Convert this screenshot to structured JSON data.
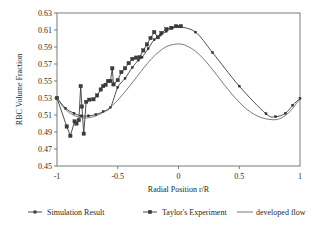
{
  "chart_data": {
    "type": "line",
    "title": "",
    "xlabel": "Radial Position r/R",
    "ylabel": "RBC Volume Fraction",
    "xlim": [
      -1,
      1
    ],
    "ylim": [
      0.45,
      0.63
    ],
    "xticks": [
      -1,
      -0.5,
      0,
      0.5,
      1
    ],
    "xticklabels": [
      "-1",
      "-0.5",
      "0",
      "0.5",
      "1"
    ],
    "yticks": [
      0.45,
      0.47,
      0.49,
      0.51,
      0.53,
      0.55,
      0.57,
      0.59,
      0.61,
      0.63
    ],
    "yticklabels": [
      "0.45",
      "0.47",
      "0.49",
      "0.51",
      "0.53",
      "0.55",
      "0.57",
      "0.59",
      "0.61",
      "0.63"
    ],
    "grid": false,
    "legend_position": "bottom",
    "series": [
      {
        "name": "Simulation Result",
        "marker": "small-dot",
        "line": true,
        "points": [
          [
            -1.0,
            0.53
          ],
          [
            -0.93,
            0.518
          ],
          [
            -0.86,
            0.512
          ],
          [
            -0.8,
            0.509
          ],
          [
            -0.74,
            0.509
          ],
          [
            -0.68,
            0.5105
          ],
          [
            -0.62,
            0.514
          ],
          [
            -0.56,
            0.519
          ],
          [
            -0.5,
            0.5425
          ],
          [
            -0.44,
            0.553
          ],
          [
            -0.38,
            0.566
          ],
          [
            -0.33,
            0.5745
          ],
          [
            -0.3,
            0.578
          ],
          [
            -0.25,
            0.588
          ],
          [
            -0.2,
            0.5985
          ],
          [
            -0.15,
            0.604
          ],
          [
            -0.1,
            0.6085
          ],
          [
            -0.05,
            0.6125
          ],
          [
            0.0,
            0.614
          ],
          [
            0.14,
            0.6075
          ],
          [
            0.28,
            0.5835
          ],
          [
            0.5,
            0.544
          ],
          [
            0.72,
            0.5115
          ],
          [
            0.8,
            0.508
          ],
          [
            0.88,
            0.512
          ],
          [
            0.94,
            0.5215
          ],
          [
            1.0,
            0.5295
          ]
        ]
      },
      {
        "name": "Taylor's Experiment",
        "marker": "square",
        "line": true,
        "points": [
          [
            -1.0,
            0.53
          ],
          [
            -0.92,
            0.4965
          ],
          [
            -0.89,
            0.4855
          ],
          [
            -0.855,
            0.5025
          ],
          [
            -0.84,
            0.5
          ],
          [
            -0.82,
            0.504
          ],
          [
            -0.805,
            0.544
          ],
          [
            -0.795,
            0.52
          ],
          [
            -0.78,
            0.488
          ],
          [
            -0.76,
            0.5255
          ],
          [
            -0.735,
            0.528
          ],
          [
            -0.7,
            0.5285
          ],
          [
            -0.67,
            0.533
          ],
          [
            -0.64,
            0.54
          ],
          [
            -0.62,
            0.544
          ],
          [
            -0.6,
            0.5455
          ],
          [
            -0.58,
            0.55
          ],
          [
            -0.56,
            0.55
          ],
          [
            -0.545,
            0.565
          ],
          [
            -0.535,
            0.546
          ],
          [
            -0.5,
            0.551
          ],
          [
            -0.47,
            0.5605
          ],
          [
            -0.44,
            0.565
          ],
          [
            -0.41,
            0.571
          ],
          [
            -0.38,
            0.576
          ],
          [
            -0.35,
            0.5775
          ],
          [
            -0.32,
            0.578
          ],
          [
            -0.29,
            0.586
          ],
          [
            -0.26,
            0.593
          ],
          [
            -0.23,
            0.6005
          ],
          [
            -0.2,
            0.6075
          ],
          [
            -0.17,
            0.6015
          ],
          [
            -0.14,
            0.6065
          ],
          [
            -0.1,
            0.611
          ],
          [
            -0.06,
            0.6125
          ],
          [
            -0.02,
            0.6145
          ],
          [
            0.02,
            0.6145
          ]
        ]
      },
      {
        "name": "developed flow",
        "marker": "none",
        "line": true,
        "points": [
          [
            -1.0,
            0.53
          ],
          [
            -0.94,
            0.518
          ],
          [
            -0.88,
            0.511
          ],
          [
            -0.82,
            0.5075
          ],
          [
            -0.76,
            0.5065
          ],
          [
            -0.7,
            0.508
          ],
          [
            -0.64,
            0.5115
          ],
          [
            -0.58,
            0.517
          ],
          [
            -0.52,
            0.5245
          ],
          [
            -0.46,
            0.534
          ],
          [
            -0.4,
            0.5445
          ],
          [
            -0.34,
            0.5555
          ],
          [
            -0.28,
            0.5665
          ],
          [
            -0.22,
            0.5765
          ],
          [
            -0.16,
            0.5845
          ],
          [
            -0.1,
            0.5905
          ],
          [
            -0.04,
            0.593
          ],
          [
            0.02,
            0.5935
          ],
          [
            0.08,
            0.5905
          ],
          [
            0.14,
            0.585
          ],
          [
            0.2,
            0.577
          ],
          [
            0.26,
            0.567
          ],
          [
            0.32,
            0.556
          ],
          [
            0.38,
            0.545
          ],
          [
            0.44,
            0.5345
          ],
          [
            0.5,
            0.525
          ],
          [
            0.56,
            0.517
          ],
          [
            0.62,
            0.511
          ],
          [
            0.68,
            0.507
          ],
          [
            0.74,
            0.505
          ],
          [
            0.8,
            0.5045
          ],
          [
            0.86,
            0.5075
          ],
          [
            0.92,
            0.5145
          ],
          [
            0.96,
            0.5215
          ],
          [
            1.0,
            0.529
          ]
        ]
      }
    ],
    "legend": [
      {
        "label": "Simulation Result",
        "style": "line-dot"
      },
      {
        "label": "Taylor's Experiment",
        "style": "line-square"
      },
      {
        "label": "developed flow",
        "style": "line-plain"
      }
    ]
  }
}
